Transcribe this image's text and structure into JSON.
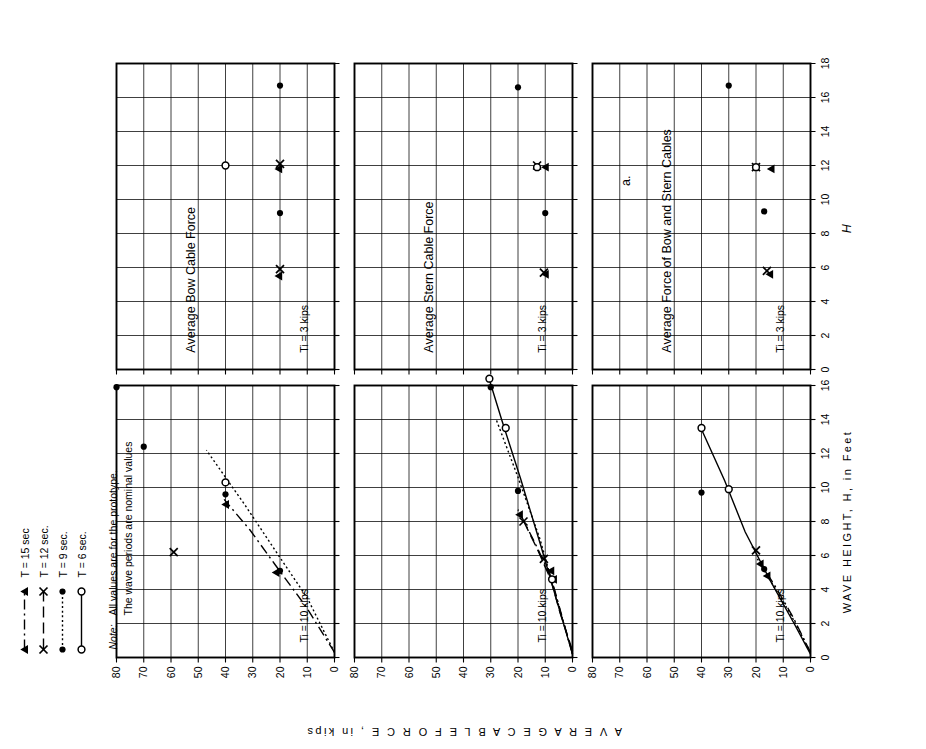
{
  "figure": {
    "part_label": "a.",
    "x_axis_title": "WAVE  HEIGHT,  H,  in Feet",
    "x_axis_symbol": "H",
    "y_axis_title": "A V E R A G E   C A B L E   F O R C E ,   in kips"
  },
  "note": {
    "word": "Note:",
    "line1": "All values are for the prototype.",
    "line2": "The wave periods are nominal values"
  },
  "legend": {
    "items": [
      {
        "label": "T = 15 sec",
        "marker": "triangle",
        "dash": "dashdot"
      },
      {
        "label": "T = 12 sec.",
        "marker": "x",
        "dash": "longdash"
      },
      {
        "label": "T = 9 sec.",
        "marker": "dot",
        "dash": "dotted"
      },
      {
        "label": "T = 6 sec.",
        "marker": "circle",
        "dash": "solid"
      }
    ]
  },
  "columns": [
    {
      "key": "c10",
      "condition": "Tᵢ = 10 kips",
      "xticks": [
        0,
        2,
        4,
        6,
        8,
        10,
        12,
        14,
        16
      ],
      "xlim": [
        0,
        16
      ]
    },
    {
      "key": "c3",
      "condition": "Tᵢ = 3 kips",
      "xticks": [
        0,
        2,
        4,
        6,
        8,
        10,
        12,
        14,
        16,
        18
      ],
      "xlim": [
        0,
        18
      ]
    }
  ],
  "rows": [
    {
      "key": "bow",
      "title": "Average Bow Cable Force"
    },
    {
      "key": "stern",
      "title": "Average Stern Cable Force"
    },
    {
      "key": "both",
      "title": "Average Force of Bow and Stern Cables"
    }
  ],
  "yticks": [
    0,
    10,
    20,
    30,
    40,
    50,
    60,
    70,
    80
  ],
  "ylim": [
    0,
    80
  ],
  "chart_data": {
    "type": "scatter",
    "xlabel": "WAVE  HEIGHT,  H,  in Feet",
    "ylabel": "AVERAGE CABLE FORCE, in kips",
    "ylim": [
      0,
      80
    ],
    "grid": true,
    "legend_position": "top-left",
    "panels": [
      {
        "row": "bow",
        "column": "c10",
        "title": "Average Bow Cable Force",
        "condition": "Ti = 10 kips",
        "xlim": [
          0,
          16
        ],
        "series": [
          {
            "name": "T = 15 sec",
            "marker": "triangle",
            "dash": "dashdot",
            "points": [
              [
                5.0,
                21.5
              ],
              [
                9.0,
                40.0
              ]
            ],
            "curve": [
              [
                0.3,
                0.0
              ],
              [
                3.0,
                10.5
              ],
              [
                5.5,
                22.0
              ],
              [
                7.5,
                31.0
              ],
              [
                9.3,
                40.5
              ]
            ]
          },
          {
            "name": "T = 12 sec.",
            "marker": "x",
            "dash": "longdash",
            "points": [
              [
                6.2,
                59.0
              ]
            ],
            "curve": []
          },
          {
            "name": "T = 9 sec.",
            "marker": "dot",
            "dash": "dotted",
            "points": [
              [
                5.1,
                20.0
              ],
              [
                9.6,
                40.0
              ],
              [
                12.4,
                70.0
              ],
              [
                15.9,
                80.0
              ]
            ],
            "curve": [
              [
                0.3,
                0.0
              ],
              [
                3.5,
                10.0
              ],
              [
                6.0,
                20.5
              ],
              [
                9.0,
                33.0
              ],
              [
                12.2,
                47.0
              ]
            ]
          },
          {
            "name": "T = 6 sec.",
            "marker": "circle",
            "dash": "solid",
            "points": [
              [
                10.3,
                40.0
              ]
            ],
            "curve": []
          }
        ]
      },
      {
        "row": "bow",
        "column": "c3",
        "title": "Average Bow Cable Force",
        "condition": "Ti = 3 kips",
        "xlim": [
          0,
          18
        ],
        "series": [
          {
            "name": "T = 15 sec",
            "marker": "triangle",
            "dash": "dashdot",
            "points": [
              [
                5.5,
                20.5
              ],
              [
                11.8,
                20.5
              ]
            ],
            "curve": []
          },
          {
            "name": "T = 12 sec.",
            "marker": "x",
            "dash": "longdash",
            "points": [
              [
                5.9,
                20.0
              ],
              [
                12.1,
                20.0
              ]
            ],
            "curve": []
          },
          {
            "name": "T = 9 sec.",
            "marker": "dot",
            "dash": "dotted",
            "points": [
              [
                9.2,
                20.0
              ],
              [
                16.7,
                20.0
              ]
            ],
            "curve": []
          },
          {
            "name": "T = 6 sec.",
            "marker": "circle",
            "dash": "solid",
            "points": [
              [
                12.0,
                40.0
              ]
            ],
            "curve": []
          }
        ]
      },
      {
        "row": "stern",
        "column": "c10",
        "title": "Average Stern Cable Force",
        "condition": "Ti = 10 kips",
        "xlim": [
          0,
          16
        ],
        "series": [
          {
            "name": "T = 15 sec",
            "marker": "triangle",
            "dash": "dashdot",
            "points": [
              [
                4.6,
                7.0
              ],
              [
                5.1,
                8.0
              ],
              [
                8.4,
                19.5
              ]
            ],
            "curve": [
              [
                0.2,
                0.0
              ],
              [
                2.5,
                4.0
              ],
              [
                4.8,
                8.0
              ],
              [
                6.8,
                14.0
              ],
              [
                8.7,
                20.0
              ]
            ]
          },
          {
            "name": "T = 12 sec.",
            "marker": "x",
            "dash": "longdash",
            "points": [
              [
                5.8,
                10.5
              ],
              [
                8.0,
                18.0
              ]
            ],
            "curve": [
              [
                0.4,
                0.0
              ],
              [
                2.6,
                4.5
              ],
              [
                4.6,
                8.0
              ],
              [
                6.4,
                13.0
              ],
              [
                8.2,
                18.5
              ]
            ]
          },
          {
            "name": "T = 9 sec.",
            "marker": "dot",
            "dash": "dotted",
            "points": [
              [
                9.8,
                20.0
              ],
              [
                15.9,
                30.0
              ]
            ],
            "curve": [
              [
                0.2,
                0.0
              ],
              [
                3.6,
                6.0
              ],
              [
                7.0,
                12.0
              ],
              [
                10.6,
                20.0
              ],
              [
                14.0,
                28.0
              ]
            ]
          },
          {
            "name": "T = 6 sec.",
            "marker": "circle",
            "dash": "solid",
            "points": [
              [
                4.6,
                7.5
              ],
              [
                13.5,
                24.5
              ],
              [
                16.4,
                30.5
              ]
            ],
            "curve": [
              [
                0.2,
                0.0
              ],
              [
                3.2,
                5.5
              ],
              [
                6.5,
                11.5
              ],
              [
                10.5,
                19.0
              ],
              [
                14.0,
                26.0
              ],
              [
                16.6,
                31.0
              ]
            ]
          }
        ]
      },
      {
        "row": "stern",
        "column": "c3",
        "title": "Average Stern Cable Force",
        "condition": "Ti = 3 kips",
        "xlim": [
          0,
          18
        ],
        "series": [
          {
            "name": "T = 15 sec",
            "marker": "triangle",
            "dash": "dashdot",
            "points": [
              [
                5.6,
                10.0
              ],
              [
                11.9,
                10.0
              ]
            ],
            "curve": []
          },
          {
            "name": "T = 12 sec.",
            "marker": "x",
            "dash": "longdash",
            "points": [
              [
                5.7,
                10.5
              ],
              [
                12.0,
                13.0
              ]
            ],
            "curve": []
          },
          {
            "name": "T = 9 sec.",
            "marker": "dot",
            "dash": "dotted",
            "points": [
              [
                9.2,
                10.0
              ],
              [
                16.6,
                20.0
              ]
            ],
            "curve": []
          },
          {
            "name": "T = 6 sec.",
            "marker": "circle",
            "dash": "solid",
            "points": [
              [
                11.9,
                13.0
              ]
            ],
            "curve": []
          }
        ]
      },
      {
        "row": "both",
        "column": "c10",
        "title": "Average Force of Bow and Stern Cables",
        "condition": "Ti = 10 kips",
        "xlim": [
          0,
          16
        ],
        "series": [
          {
            "name": "T = 15 sec",
            "marker": "triangle",
            "dash": "dashdot",
            "points": [
              [
                4.8,
                16.0
              ],
              [
                5.5,
                18.5
              ]
            ],
            "curve": [
              [
                0.3,
                0.0
              ],
              [
                2.4,
                6.5
              ],
              [
                4.2,
                13.0
              ],
              [
                5.6,
                18.5
              ]
            ]
          },
          {
            "name": "T = 12 sec.",
            "marker": "x",
            "dash": "longdash",
            "points": [
              [
                6.3,
                20.0
              ]
            ],
            "curve": []
          },
          {
            "name": "T = 9 sec.",
            "marker": "dot",
            "dash": "dotted",
            "points": [
              [
                5.2,
                17.0
              ],
              [
                9.7,
                40.0
              ]
            ],
            "curve": [
              [
                0.3,
                0.0
              ],
              [
                2.6,
                7.5
              ],
              [
                4.6,
                15.0
              ],
              [
                5.8,
                19.5
              ]
            ]
          },
          {
            "name": "T = 6 sec.",
            "marker": "circle",
            "dash": "solid",
            "points": [
              [
                9.9,
                30.0
              ],
              [
                13.5,
                40.0
              ]
            ],
            "curve": [
              [
                0.2,
                0.0
              ],
              [
                2.0,
                6.0
              ],
              [
                4.6,
                15.0
              ],
              [
                7.4,
                24.0
              ],
              [
                10.4,
                31.5
              ],
              [
                13.6,
                40.5
              ]
            ]
          }
        ]
      },
      {
        "row": "both",
        "column": "c3",
        "title": "Average Force of Bow and Stern Cables",
        "condition": "Ti = 3 kips",
        "xlim": [
          0,
          18
        ],
        "series": [
          {
            "name": "T = 15 sec",
            "marker": "triangle",
            "dash": "dashdot",
            "points": [
              [
                5.6,
                15.0
              ],
              [
                11.8,
                14.5
              ]
            ],
            "curve": []
          },
          {
            "name": "T = 12 sec.",
            "marker": "x",
            "dash": "longdash",
            "points": [
              [
                5.8,
                16.0
              ],
              [
                11.9,
                20.0
              ]
            ],
            "curve": []
          },
          {
            "name": "T = 9 sec.",
            "marker": "dot",
            "dash": "dotted",
            "points": [
              [
                9.3,
                17.0
              ],
              [
                16.7,
                30.0
              ]
            ],
            "curve": []
          },
          {
            "name": "T = 6 sec.",
            "marker": "circle",
            "dash": "solid",
            "points": [
              [
                11.9,
                20.0
              ]
            ],
            "curve": []
          }
        ]
      }
    ]
  }
}
